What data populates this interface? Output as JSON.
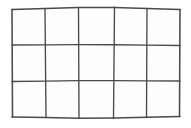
{
  "figure": {
    "kind": "line-drawing",
    "caption": "",
    "background_color": "#ffffff",
    "cell_fill_color": "#fdfdfd",
    "line_color": "#4a4a4a",
    "line_width_px": 1.35,
    "canvas_width_px": 191,
    "canvas_height_px": 128
  },
  "grid": {
    "columns": 5,
    "rows": 3,
    "cell_count": 15,
    "bounds": {
      "left_px": 12,
      "top_px": 9,
      "right_px": 180,
      "bottom_px": 117
    },
    "column_label": "columns",
    "row_label": "rows"
  },
  "chart_data": {
    "type": "line",
    "xlabel": "",
    "ylabel": "",
    "xlim": [
      0,
      191
    ],
    "ylim": [
      0,
      128
    ],
    "grid": true,
    "legend": "none",
    "vertical_lines": [
      {
        "name": "v0-left-border",
        "x_top": 12.0,
        "x_bottom": 12.5,
        "y_top": 9.5,
        "y_bottom": 117.0
      },
      {
        "name": "v1",
        "x_top": 45.0,
        "x_bottom": 46.0,
        "y_top": 9.0,
        "y_bottom": 117.5
      },
      {
        "name": "v2",
        "x_top": 78.5,
        "x_bottom": 79.0,
        "y_top": 8.5,
        "y_bottom": 118.0
      },
      {
        "name": "v3",
        "x_top": 114.5,
        "x_bottom": 113.5,
        "y_top": 7.0,
        "y_bottom": 118.5
      },
      {
        "name": "v4",
        "x_top": 147.0,
        "x_bottom": 146.5,
        "y_top": 8.5,
        "y_bottom": 117.5
      },
      {
        "name": "v5-right-border",
        "x_top": 180.0,
        "x_bottom": 179.5,
        "y_top": 9.5,
        "y_bottom": 116.5
      }
    ],
    "horizontal_lines": [
      {
        "name": "h0-top-border",
        "y_left": 9.5,
        "y_mid": 7.0,
        "y_right": 9.5,
        "x_left": 12.0,
        "x_right": 180.0
      },
      {
        "name": "h1",
        "y_left": 45.0,
        "y_mid": 44.5,
        "y_right": 45.5,
        "x_left": 12.2,
        "x_right": 179.8
      },
      {
        "name": "h2",
        "y_left": 81.5,
        "y_mid": 80.5,
        "y_right": 81.0,
        "x_left": 12.4,
        "x_right": 179.6
      },
      {
        "name": "h3-bottom-border",
        "y_left": 117.0,
        "y_mid": 118.5,
        "y_right": 116.5,
        "x_left": 12.5,
        "x_right": 179.5
      }
    ],
    "column_boundaries_px": [
      12,
      45.5,
      78.5,
      114,
      147,
      180
    ],
    "row_boundaries_px": [
      9,
      45,
      81,
      117
    ],
    "cells": [
      {
        "row": 1,
        "col": 1
      },
      {
        "row": 1,
        "col": 2
      },
      {
        "row": 1,
        "col": 3
      },
      {
        "row": 1,
        "col": 4
      },
      {
        "row": 1,
        "col": 5
      },
      {
        "row": 2,
        "col": 1
      },
      {
        "row": 2,
        "col": 2
      },
      {
        "row": 2,
        "col": 3
      },
      {
        "row": 2,
        "col": 4
      },
      {
        "row": 2,
        "col": 5
      },
      {
        "row": 3,
        "col": 1
      },
      {
        "row": 3,
        "col": 2
      },
      {
        "row": 3,
        "col": 3
      },
      {
        "row": 3,
        "col": 4
      },
      {
        "row": 3,
        "col": 5
      }
    ]
  }
}
